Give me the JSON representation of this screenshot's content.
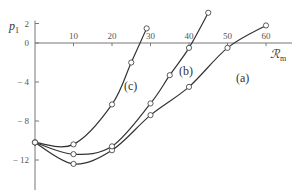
{
  "chart_data": {
    "type": "line",
    "title": "",
    "xlabel": "R_m",
    "xlabel_display": "ℛ",
    "xlabel_sub": "m",
    "ylabel": "p_1",
    "ylabel_main": "p",
    "ylabel_sub": "1",
    "xlim": [
      0,
      65
    ],
    "ylim": [
      -15,
      2.5
    ],
    "grid": false,
    "legend": "inline labels",
    "x_ticks": [
      10,
      20,
      30,
      40,
      50,
      60
    ],
    "y_ticks": [
      2,
      0,
      -4,
      -8,
      -12
    ],
    "x_tick_labels": [
      "10",
      "20",
      "30",
      "40",
      "50",
      "60"
    ],
    "y_tick_labels": [
      "2",
      "0",
      "− 4",
      "− 8",
      "− 12"
    ],
    "series": [
      {
        "name": "(a)",
        "label": "(a)",
        "x": [
          0,
          10,
          20,
          30,
          40,
          50,
          60
        ],
        "y": [
          -10.2,
          -12.4,
          -11.0,
          -7.4,
          -4.5,
          -0.5,
          1.8
        ]
      },
      {
        "name": "(b)",
        "label": "(b)",
        "x": [
          0,
          10,
          20,
          30,
          35,
          40,
          45
        ],
        "y": [
          -10.2,
          -11.4,
          -10.6,
          -6.2,
          -3.3,
          -0.5,
          3.1
        ]
      },
      {
        "name": "(c)",
        "label": "(c)",
        "x": [
          0,
          10,
          20,
          25,
          29
        ],
        "y": [
          -10.2,
          -10.4,
          -6.3,
          -2.0,
          1.5
        ]
      }
    ]
  },
  "colors": {
    "line": "#333333",
    "axis": "#777777",
    "marker_fill": "#ffffff"
  }
}
